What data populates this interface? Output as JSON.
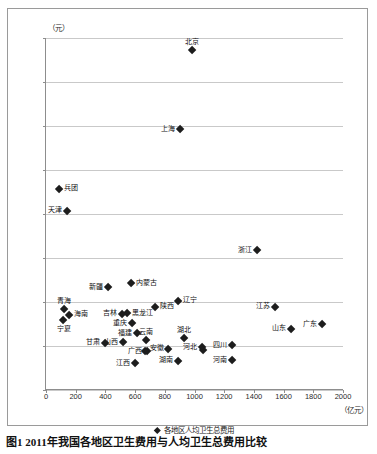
{
  "chart_data": {
    "type": "scatter",
    "title": "",
    "xlabel": "",
    "ylabel": "",
    "x_unit": "（亿元）",
    "y_unit": "（元）",
    "xlim": [
      0,
      2000
    ],
    "ylim": [
      1000,
      5000
    ],
    "xticks": [
      0,
      200,
      400,
      600,
      800,
      1000,
      1200,
      1400,
      1600,
      1800,
      2000
    ],
    "yticks": [
      1000,
      1500,
      2000,
      2500,
      3000,
      3500,
      4000,
      4500,
      5000
    ],
    "grid": "horizontal",
    "legend": [
      {
        "marker": "diamond-marker",
        "label": "各地区人均卫生总费用"
      }
    ],
    "legend_position": "bottom-center",
    "points": [
      {
        "name": "北京",
        "x": 985,
        "y": 4860,
        "label_pos": "above"
      },
      {
        "name": "上海",
        "x": 900,
        "y": 3960,
        "label_pos": "left"
      },
      {
        "name": "兵团",
        "x": 90,
        "y": 3285,
        "label_pos": "right"
      },
      {
        "name": "天津",
        "x": 140,
        "y": 3035,
        "label_pos": "left"
      },
      {
        "name": "浙江",
        "x": 1420,
        "y": 2585,
        "label_pos": "left"
      },
      {
        "name": "内蒙古",
        "x": 570,
        "y": 2215,
        "label_pos": "right"
      },
      {
        "name": "新疆",
        "x": 420,
        "y": 2165,
        "label_pos": "left"
      },
      {
        "name": "辽宁",
        "x": 890,
        "y": 2015,
        "label_pos": "right"
      },
      {
        "name": "青海",
        "x": 120,
        "y": 1925,
        "label_pos": "above"
      },
      {
        "name": "江苏",
        "x": 1545,
        "y": 1945,
        "label_pos": "left"
      },
      {
        "name": "陕西",
        "x": 735,
        "y": 1945,
        "label_pos": "right"
      },
      {
        "name": "黑龙江",
        "x": 545,
        "y": 1870,
        "label_pos": "right"
      },
      {
        "name": "海南",
        "x": 155,
        "y": 1855,
        "label_pos": "right"
      },
      {
        "name": "吉林",
        "x": 515,
        "y": 1865,
        "label_pos": "left"
      },
      {
        "name": "宁夏",
        "x": 118,
        "y": 1800,
        "label_pos": "below"
      },
      {
        "name": "重庆",
        "x": 580,
        "y": 1755,
        "label_pos": "left"
      },
      {
        "name": "广东",
        "x": 1860,
        "y": 1750,
        "label_pos": "left"
      },
      {
        "name": "山东",
        "x": 1650,
        "y": 1695,
        "label_pos": "left"
      },
      {
        "name": "福建",
        "x": 615,
        "y": 1645,
        "label_pos": "left"
      },
      {
        "name": "湖北",
        "x": 930,
        "y": 1595,
        "label_pos": "above"
      },
      {
        "name": "云南",
        "x": 675,
        "y": 1565,
        "label_pos": "above"
      },
      {
        "name": "山西",
        "x": 520,
        "y": 1545,
        "label_pos": "left"
      },
      {
        "name": "甘肃",
        "x": 400,
        "y": 1535,
        "label_pos": "left"
      },
      {
        "name": "四川",
        "x": 1255,
        "y": 1510,
        "label_pos": "left"
      },
      {
        "name": "河北",
        "x": 1050,
        "y": 1485,
        "label_pos": "left"
      },
      {
        "name": "安徽",
        "x": 825,
        "y": 1470,
        "label_pos": "left"
      },
      {
        "name": "广西",
        "x": 680,
        "y": 1440,
        "label_pos": "left"
      },
      {
        "name": "贵州",
        "x": 665,
        "y": 1440,
        "label_pos": "none"
      },
      {
        "name": "黑龙江2",
        "x": 1060,
        "y": 1450,
        "label_pos": "none"
      },
      {
        "name": "河南",
        "x": 1255,
        "y": 1335,
        "label_pos": "left"
      },
      {
        "name": "湖南",
        "x": 890,
        "y": 1330,
        "label_pos": "left"
      },
      {
        "name": "江西",
        "x": 600,
        "y": 1305,
        "label_pos": "left"
      }
    ]
  },
  "caption": "图1  2011年我国各地区卫生费用与人均卫生总费用比较"
}
